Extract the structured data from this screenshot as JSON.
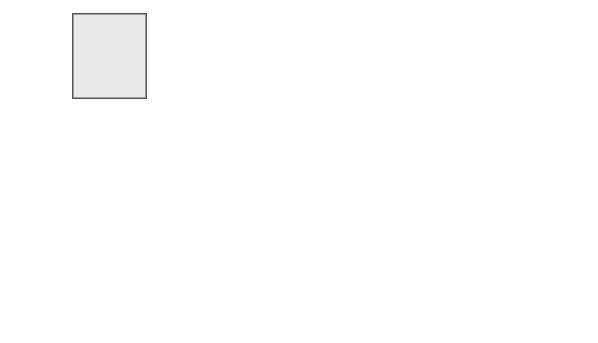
{
  "labels": {
    "all_isp_data": [
      "All",
      "ISP",
      "DATA"
    ],
    "traffic_routed": [
      "Traffic routed",
      "by ISP to",
      "FBI access point"
    ],
    "law_enforcement_device": [
      "Law",
      "Enforcement",
      "Title III/Pen",
      "Device",
      "(\"Carnivore\")"
    ],
    "original_data": "Original Data",
    "copy_of_data": "Copy of Data",
    "filter": "Filter",
    "court": "COURT",
    "law_enforcement_drawer": [
      "Law",
      "Enforcement"
    ]
  },
  "callouts": {
    "carnivore_copies": [
      "Carnivore copies all data",
      "packets from suspect's computer;",
      "original packets are sent on so",
      "suspect is never aware."
    ],
    "deleted": [
      "packet that does not meet",
      "court order deleted immediately"
    ],
    "stored": [
      "packet that does meet court",
      "order stored for later review"
    ]
  },
  "colors": {
    "band": "#e8e8e8",
    "outline": "#555555",
    "diamond": "#c9a3a3",
    "star": "#bfbfbf",
    "circle": "#b0b0b0",
    "hexagon": "#707070"
  }
}
